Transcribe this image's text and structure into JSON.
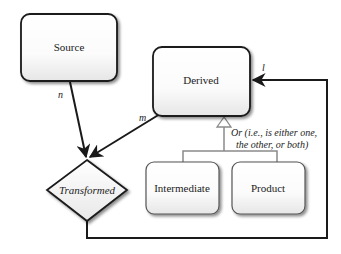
{
  "diagram": {
    "nodes": {
      "source": {
        "label": "Source",
        "shape": "rounded-rect"
      },
      "derived": {
        "label": "Derived",
        "shape": "rounded-rect"
      },
      "transformed": {
        "label": "Transformed",
        "shape": "diamond"
      },
      "intermediate": {
        "label": "Intermediate",
        "shape": "rounded-rect"
      },
      "product": {
        "label": "Product",
        "shape": "rounded-rect"
      }
    },
    "edges": {
      "source_to_transformed": {
        "label": "n"
      },
      "derived_to_transformed": {
        "label": "m"
      },
      "transformed_to_derived": {
        "label": "l"
      },
      "generalization": {
        "line1": "Or (i.e., is either one,",
        "line2": "the other, or both)"
      }
    },
    "colors": {
      "stroke": "#1a1a1a",
      "generalization_stroke": "#8a8a8a",
      "node_fill_top": "#ffffff",
      "node_fill_bottom": "#ececec"
    }
  }
}
